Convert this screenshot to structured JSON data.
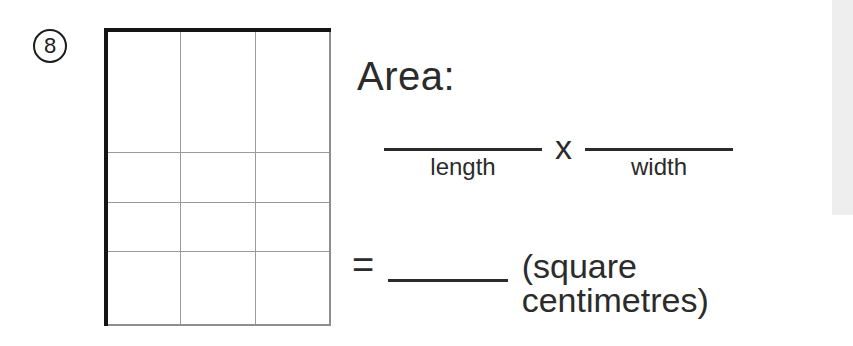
{
  "page": {
    "background_color": "#ffffff",
    "ink_color": "#2b2b2b"
  },
  "question": {
    "number": "8",
    "prompt_label": "Area:"
  },
  "grid": {
    "columns": 3,
    "rows": 4,
    "total_cells": 12,
    "outer_border_color": "#141414",
    "inner_line_color": "#9a9a9a"
  },
  "formula": {
    "length_blank": "",
    "length_caption": "length",
    "operator": "x",
    "width_blank": "",
    "width_caption": "width"
  },
  "result": {
    "equals": "=",
    "answer_blank": "",
    "units": "(square centimetres)"
  }
}
